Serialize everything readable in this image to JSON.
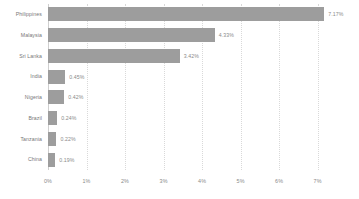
{
  "chart_data": {
    "type": "bar",
    "orientation": "horizontal",
    "title": "",
    "subtitle": "",
    "xlabel": "",
    "ylabel": "",
    "xlim": [
      0,
      7.4
    ],
    "categories": [
      "Philippines",
      "Malaysia",
      "Sri Lanka",
      "India",
      "Nigeria",
      "Brazil",
      "Tanzania",
      "China"
    ],
    "values": [
      7.17,
      4.33,
      3.42,
      0.45,
      0.42,
      0.24,
      0.22,
      0.19
    ],
    "value_labels": [
      "7.17%",
      "4.33%",
      "3.42%",
      "0.45%",
      "0.42%",
      "0.24%",
      "0.22%",
      "0.19%"
    ],
    "xticks": [
      0,
      1,
      2,
      3,
      4,
      5,
      6,
      7
    ],
    "xtick_labels": [
      "0%",
      "1%",
      "2%",
      "3%",
      "4%",
      "5%",
      "6%",
      "7%"
    ],
    "grid": true,
    "grid_style": "dotted-vertical",
    "legend": false,
    "bar_color": "#9d9d9d",
    "grid_color": "#d9d9d9",
    "axis_color": "#cfcfcf",
    "text_color": "#7a7a7a",
    "background": "#ffffff"
  }
}
